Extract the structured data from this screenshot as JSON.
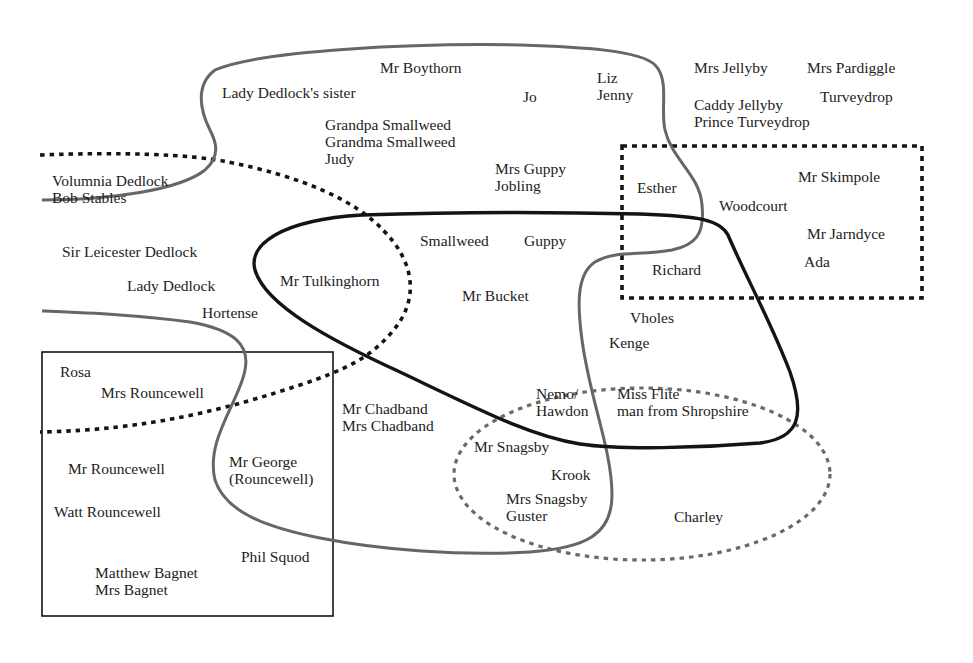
{
  "diagram": {
    "type": "character-grouping-venn",
    "colors": {
      "background": "#ffffff",
      "solid_black": "#141414",
      "grey_line": "#666666",
      "text": "#222222"
    },
    "regions": [
      {
        "id": "grey-blob",
        "style": "solid grey curve"
      },
      {
        "id": "black-loop",
        "style": "solid black curve"
      },
      {
        "id": "black-dotted-curve",
        "style": "dotted black curve"
      },
      {
        "id": "dotted-box",
        "style": "dotted black rectangle"
      },
      {
        "id": "solid-box",
        "style": "thin black rectangle"
      },
      {
        "id": "grey-dotted-ellipse",
        "style": "dotted grey ellipse"
      }
    ],
    "labels": [
      {
        "text": "Mr Boythorn",
        "x": 380,
        "y": 59
      },
      {
        "text": "Lady Dedlock's sister",
        "x": 222,
        "y": 84
      },
      {
        "text": "Jo",
        "x": 523,
        "y": 88
      },
      {
        "text": "Liz\nJenny",
        "x": 597,
        "y": 69
      },
      {
        "text": "Mrs Jellyby",
        "x": 694,
        "y": 59
      },
      {
        "text": "Mrs Pardiggle",
        "x": 807,
        "y": 59
      },
      {
        "text": "Turveydrop",
        "x": 820,
        "y": 88
      },
      {
        "text": "Caddy Jellyby\nPrince Turveydrop",
        "x": 694,
        "y": 96
      },
      {
        "text": "Grandpa Smallweed\nGrandma Smallweed\nJudy",
        "x": 325,
        "y": 116
      },
      {
        "text": "Mrs Guppy\nJobling",
        "x": 495,
        "y": 160
      },
      {
        "text": "Volumnia Dedlock\nBob Stables",
        "x": 52,
        "y": 172
      },
      {
        "text": "Esther",
        "x": 637,
        "y": 179
      },
      {
        "text": "Mr Skimpole",
        "x": 798,
        "y": 168
      },
      {
        "text": "Woodcourt",
        "x": 719,
        "y": 197
      },
      {
        "text": "Mr Jarndyce",
        "x": 807,
        "y": 225
      },
      {
        "text": "Ada",
        "x": 804,
        "y": 253
      },
      {
        "text": "Smallweed",
        "x": 420,
        "y": 232
      },
      {
        "text": "Guppy",
        "x": 524,
        "y": 232
      },
      {
        "text": "Sir Leicester Dedlock",
        "x": 62,
        "y": 243
      },
      {
        "text": "Richard",
        "x": 652,
        "y": 261
      },
      {
        "text": "Lady Dedlock",
        "x": 127,
        "y": 277
      },
      {
        "text": "Mr Tulkinghorn",
        "x": 280,
        "y": 272
      },
      {
        "text": "Mr Bucket",
        "x": 462,
        "y": 287
      },
      {
        "text": "Hortense",
        "x": 202,
        "y": 304
      },
      {
        "text": "Vholes",
        "x": 630,
        "y": 309
      },
      {
        "text": "Kenge",
        "x": 609,
        "y": 334
      },
      {
        "text": "Rosa",
        "x": 60,
        "y": 363
      },
      {
        "text": "Mrs Rouncewell",
        "x": 101,
        "y": 384
      },
      {
        "text": "Nemo/\nHawdon",
        "x": 536,
        "y": 385
      },
      {
        "text": "Miss Flite\nman from Shropshire",
        "x": 617,
        "y": 385
      },
      {
        "text": "Mr Chadband\nMrs Chadband",
        "x": 342,
        "y": 400
      },
      {
        "text": "Mr Snagsby",
        "x": 474,
        "y": 438
      },
      {
        "text": "Mr Rouncewell",
        "x": 68,
        "y": 460
      },
      {
        "text": "Mr George\n(Rouncewell)",
        "x": 229,
        "y": 453
      },
      {
        "text": "Krook",
        "x": 551,
        "y": 466
      },
      {
        "text": "Mrs Snagsby\nGuster",
        "x": 506,
        "y": 490
      },
      {
        "text": "Watt Rouncewell",
        "x": 54,
        "y": 503
      },
      {
        "text": "Charley",
        "x": 674,
        "y": 508
      },
      {
        "text": "Phil Squod",
        "x": 241,
        "y": 548
      },
      {
        "text": "Matthew Bagnet\nMrs Bagnet",
        "x": 95,
        "y": 564
      }
    ]
  }
}
